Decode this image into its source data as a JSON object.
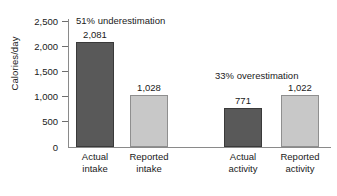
{
  "chart_data": {
    "type": "bar",
    "title": "",
    "xlabel": "",
    "ylabel": "Calories/day",
    "ylim": [
      0,
      2500
    ],
    "grid": false,
    "legend": "none",
    "categories": [
      "Actual intake",
      "Reported intake",
      "Actual activity",
      "Reported activity"
    ],
    "values": [
      2081,
      1028,
      771,
      1022
    ],
    "value_labels": [
      "2,081",
      "1,028",
      "771",
      "1,022"
    ],
    "bar_styles": [
      "dark",
      "light",
      "dark",
      "light"
    ],
    "ytick_values": [
      0,
      500,
      1000,
      1500,
      2000,
      2500
    ],
    "ytick_labels": [
      "0",
      "500",
      "1,000",
      "1,500",
      "2,000",
      "2,500"
    ],
    "annotations": [
      {
        "text": "51% underestimation"
      },
      {
        "text": "33% overestimation"
      }
    ],
    "colors": {
      "dark_bar": "#595959",
      "light_bar": "#c8c8c8",
      "axis": "#8a8a8a",
      "text": "#1a1a1a",
      "background": "#ffffff"
    }
  },
  "category_lines": [
    {
      "line1": "Actual",
      "line2": "intake"
    },
    {
      "line1": "Reported",
      "line2": "intake"
    },
    {
      "line1": "Actual",
      "line2": "activity"
    },
    {
      "line1": "Reported",
      "line2": "activity"
    }
  ]
}
